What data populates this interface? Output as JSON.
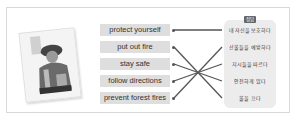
{
  "exercise": {
    "illustration": "firefighter-photo",
    "answer_badge": "정답",
    "english_phrases": [
      {
        "label": "protect yourself"
      },
      {
        "label": "put out fire"
      },
      {
        "label": "stay safe"
      },
      {
        "label": "follow directions"
      },
      {
        "label": "prevent forest fires"
      }
    ],
    "korean_phrases": [
      {
        "label": "내 자신을 보호하다"
      },
      {
        "label": "산불들을 예방하다"
      },
      {
        "label": "지시들을 따르다"
      },
      {
        "label": "안전하게 있다"
      },
      {
        "label": "불을 끄다"
      }
    ],
    "matches": [
      {
        "from": "protect yourself",
        "to": "내 자신을 보호하다"
      },
      {
        "from": "put out fire",
        "to": "불을 끄다"
      },
      {
        "from": "stay safe",
        "to": "안전하게 있다"
      },
      {
        "from": "follow directions",
        "to": "지시들을 따르다"
      },
      {
        "from": "prevent forest fires",
        "to": "산불들을 예방하다"
      }
    ],
    "colors": {
      "box": "#dedede",
      "line": "#555555",
      "panel": "#ececec"
    }
  }
}
